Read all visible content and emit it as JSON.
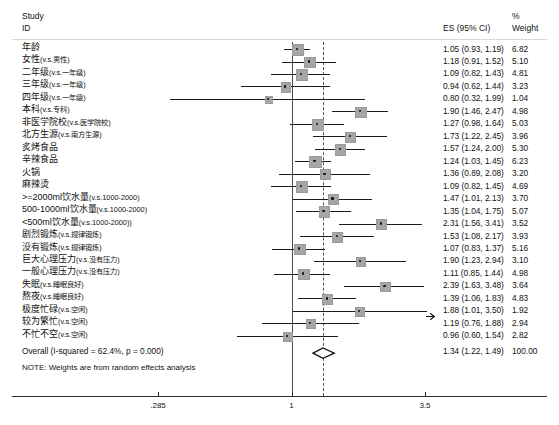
{
  "header": {
    "col_study": "Study",
    "col_id": "ID",
    "col_es": "ES (95% CI)",
    "col_pct": "%",
    "col_weight": "Weight"
  },
  "note": "NOTE: Weights are from random effects analysis",
  "overall": {
    "label": "Overall  (I-squared = 62.4%, p = 0.000)",
    "es_text": "1.34 (1.22, 1.49)",
    "weight": "100.00",
    "es": 1.34,
    "lo": 1.22,
    "hi": 1.49
  },
  "axis": {
    "type": "log",
    "ticks": [
      ".285",
      "1",
      "3.5"
    ],
    "tick_values": [
      0.285,
      1,
      3.5
    ],
    "ref_line": 1,
    "pooled_line": 1.34
  },
  "chart_data": {
    "type": "forest",
    "title": "",
    "xlabel": "",
    "ylabel": "",
    "effect_measure": "ES (95% CI)",
    "scale": "log",
    "xlim": [
      0.285,
      3.5
    ],
    "rows": [
      {
        "label": "年龄",
        "sub": "",
        "es": 1.05,
        "lo": 0.93,
        "hi": 1.19,
        "es_text": "1.05 (0.93, 1.19)",
        "weight": 6.82
      },
      {
        "label": "女性",
        "sub": "(v.s.男性)",
        "es": 1.18,
        "lo": 0.91,
        "hi": 1.52,
        "es_text": "1.18 (0.91, 1.52)",
        "weight": 5.1
      },
      {
        "label": "二年级",
        "sub": "(v.s.一年级)",
        "es": 1.09,
        "lo": 0.82,
        "hi": 1.43,
        "es_text": "1.09 (0.82, 1.43)",
        "weight": 4.81
      },
      {
        "label": "三年级",
        "sub": "(v.s.一年级)",
        "es": 0.94,
        "lo": 0.62,
        "hi": 1.44,
        "es_text": "0.94 (0.62, 1.44)",
        "weight": 3.23
      },
      {
        "label": "四年级",
        "sub": "(v.s.一年级)",
        "es": 0.8,
        "lo": 0.32,
        "hi": 1.99,
        "es_text": "0.80 (0.32, 1.99)",
        "weight": 1.04
      },
      {
        "label": "本科",
        "sub": "(v.s.专科)",
        "es": 1.9,
        "lo": 1.46,
        "hi": 2.47,
        "es_text": "1.90 (1.46, 2.47)",
        "weight": 4.98
      },
      {
        "label": "非医学院校",
        "sub": "(v.s.医学院校)",
        "es": 1.27,
        "lo": 0.98,
        "hi": 1.64,
        "es_text": "1.27 (0.98, 1.64)",
        "weight": 5.03
      },
      {
        "label": "北方生源",
        "sub": "(v.s.南方生源)",
        "es": 1.73,
        "lo": 1.22,
        "hi": 2.45,
        "es_text": "1.73 (1.22, 2.45)",
        "weight": 3.96
      },
      {
        "label": "炙烤食品",
        "sub": "",
        "es": 1.57,
        "lo": 1.24,
        "hi": 2.0,
        "es_text": "1.57 (1.24, 2.00)",
        "weight": 5.3
      },
      {
        "label": "辛辣食品",
        "sub": "",
        "es": 1.24,
        "lo": 1.03,
        "hi": 1.45,
        "es_text": "1.24 (1.03, 1.45)",
        "weight": 6.23
      },
      {
        "label": "火锅",
        "sub": "",
        "es": 1.36,
        "lo": 0.89,
        "hi": 2.08,
        "es_text": "1.36 (0.89, 2.08)",
        "weight": 3.2
      },
      {
        "label": "麻辣烫",
        "sub": "",
        "es": 1.09,
        "lo": 0.82,
        "hi": 1.45,
        "es_text": "1.09 (0.82, 1.45)",
        "weight": 4.69
      },
      {
        "label": ">=2000ml饮水量",
        "sub": "(v.s.1000-2000)",
        "es": 1.47,
        "lo": 1.01,
        "hi": 2.13,
        "es_text": "1.47 (1.01, 2.13)",
        "weight": 3.7
      },
      {
        "label": "500-1000ml饮水量",
        "sub": "(v.s.1000-2000)",
        "es": 1.35,
        "lo": 1.04,
        "hi": 1.75,
        "es_text": "1.35 (1.04, 1.75)",
        "weight": 5.07
      },
      {
        "label": "<500ml饮水量",
        "sub": "(v.s.1000-2000))",
        "es": 2.31,
        "lo": 1.56,
        "hi": 3.41,
        "es_text": "2.31 (1.56, 3.41)",
        "weight": 3.52
      },
      {
        "label": "剧烈锻炼",
        "sub": "(v.s.规律锻炼)",
        "es": 1.53,
        "lo": 1.08,
        "hi": 2.17,
        "es_text": "1.53 (1.08, 2.17)",
        "weight": 3.93
      },
      {
        "label": "没有锻炼",
        "sub": "(v.s.规律锻炼)",
        "es": 1.07,
        "lo": 0.83,
        "hi": 1.37,
        "es_text": "1.07 (0.83, 1.37)",
        "weight": 5.16
      },
      {
        "label": "巨大心理压力",
        "sub": "(v.s.没有压力)",
        "es": 1.9,
        "lo": 1.23,
        "hi": 2.94,
        "es_text": "1.90 (1.23, 2.94)",
        "weight": 3.1
      },
      {
        "label": "一般心理压力",
        "sub": "(v.s.没有压力)",
        "es": 1.11,
        "lo": 0.85,
        "hi": 1.44,
        "es_text": "1.11 (0.85, 1.44)",
        "weight": 4.98
      },
      {
        "label": "失眠",
        "sub": "(v.s.睡眠良好)",
        "es": 2.39,
        "lo": 1.63,
        "hi": 3.48,
        "es_text": "2.39 (1.63, 3.48)",
        "weight": 3.64
      },
      {
        "label": "熬夜",
        "sub": "(v.s.睡眠良好)",
        "es": 1.39,
        "lo": 1.06,
        "hi": 1.83,
        "es_text": "1.39 (1.06, 1.83)",
        "weight": 4.83
      },
      {
        "label": "极度忙碌",
        "sub": "(v.s.空闲)",
        "es": 1.88,
        "lo": 1.01,
        "hi": 3.5,
        "es_text": "1.88 (1.01, 3.50)",
        "weight": 1.92,
        "clip_right": true
      },
      {
        "label": "较为繁忙",
        "sub": "(v.s.空闲)",
        "es": 1.19,
        "lo": 0.76,
        "hi": 1.88,
        "es_text": "1.19 (0.76, 1.88)",
        "weight": 2.94
      },
      {
        "label": "不忙不空",
        "sub": "(v.s.空闲)",
        "es": 0.96,
        "lo": 0.6,
        "hi": 1.54,
        "es_text": "0.96 (0.60, 1.54)",
        "weight": 2.82
      }
    ]
  }
}
